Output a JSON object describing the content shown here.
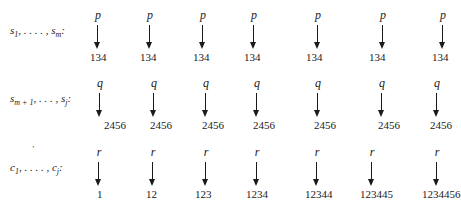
{
  "rows": [
    {
      "label_html": "s<sub>1</sub>, . . . . , s<sub>m</sub>:",
      "label_text": "s1, . . . , sm:",
      "symbol": "p",
      "values": [
        "134",
        "134",
        "134",
        "134",
        "134",
        "134",
        "134"
      ]
    },
    {
      "label_text": "sm+1, . . . , sj:",
      "symbol": "q",
      "values": [
        "2456",
        "2456",
        "2456",
        "2456",
        "2456",
        "2456",
        "2456"
      ]
    },
    {
      "label_text": "c1, . . . , cj:",
      "symbol": "r",
      "values": [
        "1",
        "12",
        "123",
        "1234",
        "12344",
        "123445",
        "1234456"
      ]
    }
  ],
  "labels": {
    "row0": {
      "main": "s",
      "sub1": "1",
      "mid": ", . . . . , s",
      "sub2": "m",
      "end": ":"
    },
    "row1": {
      "main": "s",
      "sub1": "m + 1",
      "mid": ", . . . , s",
      "sub2": "j",
      "end": ":"
    },
    "row2": {
      "main": "c",
      "sub1": "1",
      "mid": ", . . . . , c",
      "sub2": "j",
      "end": ":",
      "prime_mark": "′"
    }
  }
}
